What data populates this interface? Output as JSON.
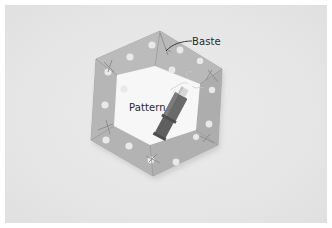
{
  "image": {
    "description": "Grayscale photo of an English paper piecing hexagon: polka-dot fabric folded over a white hexagon paper pattern and basted at the corners, with a thread spool lying diagonally across the center.",
    "background_color": "#e6e6e6",
    "border_color": "#ffffff"
  },
  "labels": {
    "baste": "Baste",
    "pattern": "Pattern"
  }
}
